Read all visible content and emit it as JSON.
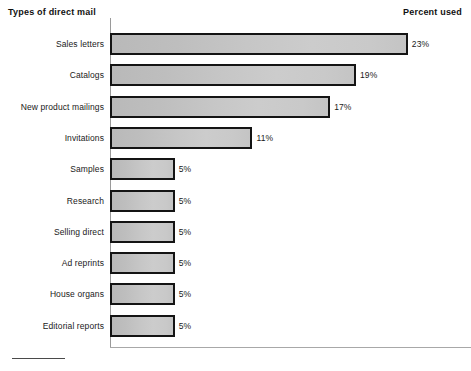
{
  "header": {
    "left_title": "Types of direct mail",
    "right_title": "Percent used"
  },
  "axis": {
    "has_y_axis": true,
    "has_x_axis": true,
    "grid": false
  },
  "footnote": {
    "rule": ""
  },
  "chart_data": {
    "type": "bar",
    "orientation": "horizontal",
    "title": "",
    "xlabel": "Percent used",
    "ylabel": "Types of direct mail",
    "categories": [
      "Sales letters",
      "Catalogs",
      "New product mailings",
      "Invitations",
      "Samples",
      "Research",
      "Selling direct",
      "Ad reprints",
      "House organs",
      "Editorial reports"
    ],
    "values": [
      23,
      19,
      17,
      11,
      5,
      5,
      5,
      5,
      5,
      5
    ],
    "value_labels": [
      "23%",
      "19%",
      "17%",
      "11%",
      "5%",
      "5%",
      "5%",
      "5%",
      "5%",
      "5%"
    ],
    "xlim": [
      0,
      23
    ],
    "grid": false,
    "legend": null,
    "bar_fill": "#c6c6c6",
    "bar_border": "#141414",
    "bars": [
      {
        "label": "Sales letters",
        "value": 23,
        "value_label": "23%"
      },
      {
        "label": "Catalogs",
        "value": 19,
        "value_label": "19%"
      },
      {
        "label": "New product mailings",
        "value": 17,
        "value_label": "17%"
      },
      {
        "label": "Invitations",
        "value": 11,
        "value_label": "11%"
      },
      {
        "label": "Samples",
        "value": 5,
        "value_label": "5%"
      },
      {
        "label": "Research",
        "value": 5,
        "value_label": "5%"
      },
      {
        "label": "Selling direct",
        "value": 5,
        "value_label": "5%"
      },
      {
        "label": "Ad reprints",
        "value": 5,
        "value_label": "5%"
      },
      {
        "label": "House organs",
        "value": 5,
        "value_label": "5%"
      },
      {
        "label": "Editorial reports",
        "value": 5,
        "value_label": "5%"
      }
    ]
  }
}
